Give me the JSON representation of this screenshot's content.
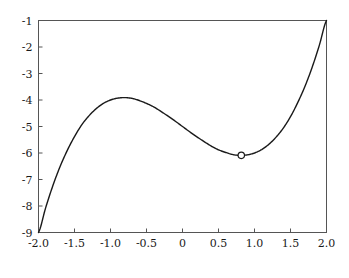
{
  "figure": {
    "background_color": "#ffffff",
    "caption_text": ""
  },
  "chart_data": {
    "type": "line",
    "title": "",
    "xlabel": "",
    "ylabel": "",
    "xlim": [
      -2.0,
      2.0
    ],
    "ylim": [
      -9,
      -1
    ],
    "grid": false,
    "legend": null,
    "line_color": "#1a1a1a",
    "line_width": 1.4,
    "frame_color": "#555555",
    "xticks": [
      -2.0,
      -1.5,
      -1.0,
      -0.5,
      0,
      0.5,
      1.0,
      1.5,
      2.0
    ],
    "xtick_labels": [
      "-2.0",
      "-1.5",
      "-1.0",
      "-0.5",
      "0",
      "0.5",
      "1.0",
      "1.5",
      "2.0"
    ],
    "yticks": [
      -1,
      -2,
      -3,
      -4,
      -5,
      -6,
      -7,
      -8,
      -9
    ],
    "ytick_labels": [
      "-1",
      "-2",
      "-3",
      "-4",
      "-5",
      "-6",
      "-7",
      "-8",
      "-9"
    ],
    "function": "f(x) = x^3 - 2x - 5",
    "series": [
      {
        "name": "f(x) = x^3 - 2x - 5",
        "x": [
          -2.0,
          -1.9,
          -1.8,
          -1.7,
          -1.6,
          -1.5,
          -1.4,
          -1.3,
          -1.2,
          -1.1,
          -1.0,
          -0.9,
          -0.8,
          -0.7,
          -0.6,
          -0.5,
          -0.4,
          -0.3,
          -0.2,
          -0.1,
          0.0,
          0.1,
          0.2,
          0.3,
          0.4,
          0.5,
          0.6,
          0.7,
          0.8,
          0.9,
          1.0,
          1.1,
          1.2,
          1.3,
          1.4,
          1.5,
          1.6,
          1.7,
          1.8,
          1.9,
          2.0
        ],
        "y": [
          -9.0,
          -8.06,
          -7.23,
          -6.51,
          -5.9,
          -5.38,
          -4.94,
          -4.6,
          -4.33,
          -4.13,
          -4.0,
          -3.93,
          -3.91,
          -3.94,
          -4.02,
          -4.13,
          -4.26,
          -4.43,
          -4.61,
          -4.8,
          -5.0,
          -5.2,
          -5.39,
          -5.57,
          -5.74,
          -5.88,
          -5.98,
          -6.06,
          -6.09,
          -6.07,
          -6.0,
          -5.87,
          -5.67,
          -5.4,
          -5.06,
          -4.63,
          -4.1,
          -3.49,
          -2.77,
          -1.94,
          -1.0
        ]
      }
    ],
    "markers": [
      {
        "name": "local-minimum",
        "x": 0.8165,
        "y": -6.0887,
        "style": "open-circle",
        "radius": 3.2,
        "edge_color": "#1a1a1a",
        "face_color": "#ffffff"
      }
    ]
  }
}
